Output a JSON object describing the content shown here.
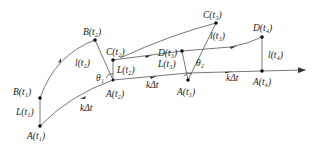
{
  "diagram": {
    "title": "",
    "points": [
      {
        "id": "A1",
        "label": "A",
        "sub": "1",
        "x": 40,
        "y": 126
      },
      {
        "id": "B1",
        "label": "B",
        "sub": "1",
        "x": 40,
        "y": 98
      },
      {
        "id": "B2",
        "label": "B",
        "sub": "2",
        "x": 95,
        "y": 40
      },
      {
        "id": "A2",
        "label": "A",
        "sub": "2",
        "x": 113,
        "y": 80
      },
      {
        "id": "C2",
        "label": "C",
        "sub": "2",
        "x": 113,
        "y": 60
      },
      {
        "id": "A3",
        "label": "A",
        "sub": "3",
        "x": 188,
        "y": 80
      },
      {
        "id": "D3",
        "label": "D",
        "sub": "3",
        "x": 182,
        "y": 51
      },
      {
        "id": "C3",
        "label": "C",
        "sub": "3",
        "x": 216,
        "y": 23
      },
      {
        "id": "D4",
        "label": "D",
        "sub": "4",
        "x": 262,
        "y": 37
      },
      {
        "id": "A4",
        "label": "A",
        "sub": "4",
        "x": 262,
        "y": 71
      }
    ],
    "labels": {
      "A1": "A(t₁)",
      "B1": "B(t₁)",
      "L1": "L(t₁)",
      "B2": "B(t₂)",
      "l2": "l(t₂)",
      "C2": "C(t₂)",
      "L2": "L(t₂)",
      "theta1": "θ₁",
      "A2": "A(t₂)",
      "kdt1": "kΔt",
      "kdt2": "kΔt",
      "kdt3": "kΔt",
      "C3": "C(t₃)",
      "l3": "l(t₃)",
      "D3": "D(t₃)",
      "L3": "L(t₃)",
      "theta2": "θ₂",
      "A3": "A(t₃)",
      "D4": "D(t₄)",
      "l4": "l(t₄)",
      "A4": "A(t₄)"
    },
    "colors": {
      "line": "#555555",
      "point": "#111111",
      "text": "#222222",
      "background": "#ffffff"
    }
  }
}
